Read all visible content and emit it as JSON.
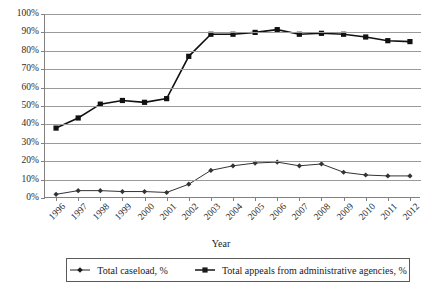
{
  "chart_data": {
    "type": "line",
    "title": "",
    "xlabel": "Year",
    "ylabel": "",
    "categories": [
      "1996",
      "1997",
      "1998",
      "1999",
      "2000",
      "2001",
      "2002",
      "2003",
      "2004",
      "2005",
      "2006",
      "2007",
      "2008",
      "2009",
      "2010",
      "2011",
      "2012"
    ],
    "ylim": [
      0,
      100
    ],
    "yticks": [
      "0%",
      "10%",
      "20%",
      "30%",
      "40%",
      "50%",
      "60%",
      "70%",
      "80%",
      "90%",
      "100%"
    ],
    "ytick_values": [
      0,
      10,
      20,
      30,
      40,
      50,
      60,
      70,
      80,
      90,
      100
    ],
    "grid": true,
    "legend_position": "bottom",
    "series": [
      {
        "name": "Total caseload, %",
        "marker": "diamond",
        "color": "#333333",
        "values": [
          2,
          4,
          4,
          3.5,
          3.5,
          3,
          7.5,
          15,
          17.5,
          19,
          19.5,
          17.5,
          18.5,
          14,
          12.5,
          12,
          12
        ]
      },
      {
        "name": "Total appeals from administrative agencies, %",
        "marker": "square",
        "color": "#111111",
        "values": [
          38,
          43.5,
          51,
          53,
          52,
          54,
          77,
          89,
          89,
          90,
          91.5,
          89,
          89.5,
          89,
          87.5,
          85.5,
          85
        ]
      }
    ]
  },
  "legend": {
    "items": [
      {
        "label": "Total caseload, %",
        "marker": "diamond"
      },
      {
        "label": "Total appeals from administrative agencies, %",
        "marker": "square"
      }
    ]
  }
}
